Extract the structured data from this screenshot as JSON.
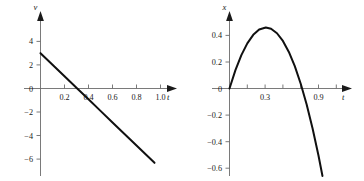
{
  "figure": {
    "title": "",
    "panel_count": 2
  },
  "chart_data": [
    {
      "id": "velocity-graph",
      "type": "line",
      "title": "",
      "xlabel": "t",
      "ylabel": "v",
      "xlim": [
        0,
        1.12
      ],
      "ylim": [
        -6.6,
        4.8
      ],
      "xticks": [
        0.2,
        0.4,
        0.6,
        0.8,
        1.0
      ],
      "xticklabels": [
        "0.2",
        "0.4",
        "0.6",
        "0.8",
        "1.0"
      ],
      "yticks": [
        4,
        2,
        0,
        -2,
        -4,
        -6
      ],
      "yticklabels": [
        "4",
        "2",
        "0",
        "−2",
        "−4",
        "−6"
      ],
      "grid": false,
      "legend": false,
      "series": [
        {
          "name": "v(t) = 3 − 9.8t",
          "x": [
            0.0,
            0.1,
            0.2,
            0.306,
            0.4,
            0.5,
            0.6,
            0.7,
            0.8,
            0.9,
            0.95
          ],
          "y": [
            3.0,
            2.02,
            1.04,
            0.0,
            -0.92,
            -1.9,
            -2.88,
            -3.86,
            -4.84,
            -5.82,
            -6.31
          ]
        }
      ],
      "annotations": {
        "y_intercept": 3.0,
        "zero_crossing_t": 0.306,
        "slope": -9.8
      }
    },
    {
      "id": "position-graph",
      "type": "line",
      "title": "",
      "xlabel": "t",
      "ylabel": "x",
      "xlim": [
        0,
        1.12
      ],
      "ylim": [
        -0.68,
        0.52
      ],
      "xticks": [
        0.3,
        0.9
      ],
      "xticklabels": [
        "0.3",
        "0.9"
      ],
      "xminorticks": [
        0.15,
        0.45,
        0.6,
        0.75,
        1.05
      ],
      "yticks": [
        0.4,
        0.2,
        0,
        -0.2,
        -0.4,
        -0.6
      ],
      "yticklabels": [
        "0.4",
        "0.2",
        "0",
        "−0.2",
        "−0.4",
        "−0.6"
      ],
      "grid": false,
      "legend": false,
      "series": [
        {
          "name": "x(t) = 3t − 4.9t²",
          "x": [
            0.0,
            0.05,
            0.1,
            0.15,
            0.2,
            0.25,
            0.306,
            0.35,
            0.4,
            0.45,
            0.5,
            0.55,
            0.6,
            0.65,
            0.7,
            0.75,
            0.8,
            0.85,
            0.9,
            0.95
          ],
          "y": [
            0.0,
            0.138,
            0.251,
            0.34,
            0.404,
            0.444,
            0.459,
            0.45,
            0.416,
            0.358,
            0.275,
            0.168,
            0.036,
            -0.121,
            -0.301,
            -0.506,
            -0.736,
            -0.99,
            -1.269,
            -1.572
          ]
        }
      ],
      "annotations": {
        "peak_t": 0.306,
        "peak_x": 0.459,
        "zero_crossing_t": 0.612
      }
    }
  ],
  "panels": [
    {
      "name": "left-panel",
      "y_axis_label": "v",
      "x_axis_label": "t",
      "y_tick_labels": [
        "4",
        "2",
        "0",
        "−2",
        "−4",
        "−6"
      ],
      "x_tick_labels": [
        "0.2",
        "0.4",
        "0.6",
        "0.8",
        "1.0"
      ]
    },
    {
      "name": "right-panel",
      "y_axis_label": "x",
      "x_axis_label": "t",
      "y_tick_labels": [
        "0.4",
        "0.2",
        "0",
        "−0.2",
        "−0.4",
        "−0.6"
      ],
      "x_tick_labels": [
        "0.3",
        "0.9"
      ]
    }
  ],
  "colors": {
    "curve": "#101010",
    "axis": "#6b6b6b",
    "text": "#1a1a1a",
    "background": "#ffffff"
  }
}
